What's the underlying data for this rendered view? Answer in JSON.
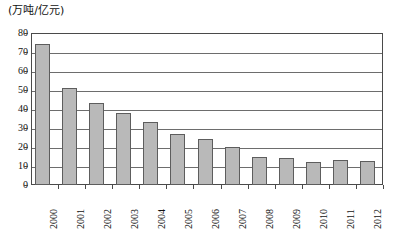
{
  "chart_data": {
    "type": "bar",
    "title": "",
    "subtitle": "",
    "unit_label": "(万吨/亿元)",
    "xlabel": "",
    "ylabel": "",
    "categories": [
      "2000",
      "2001",
      "2002",
      "2003",
      "2004",
      "2005",
      "2006",
      "2007",
      "2008",
      "2009",
      "2010",
      "2011",
      "2012"
    ],
    "values": [
      74,
      51,
      43,
      38,
      33,
      27,
      24,
      20,
      15,
      14,
      12,
      13,
      12.5
    ],
    "ylim": [
      0,
      80
    ],
    "ytick_values": [
      0,
      10,
      20,
      30,
      40,
      50,
      60,
      70,
      80
    ],
    "ytick_labels": [
      "0",
      "10",
      "20",
      "30",
      "40",
      "50",
      "60",
      "70",
      "80"
    ],
    "grid": true,
    "grid_axis": "y",
    "legend": false,
    "legend_position": "none",
    "bar_color": "#b9b9b9",
    "bar_border_color": "#5d5d5d",
    "axis_color": "#4a4a4a",
    "gridline_color": "#6d6d6d",
    "xtick_rotation": -90
  }
}
